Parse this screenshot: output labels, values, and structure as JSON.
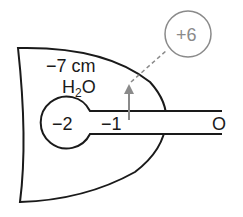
{
  "diagram": {
    "labels": {
      "pleural_pressure": "−7 cm",
      "pleural_unit": "H",
      "pleural_unit_sub": "2",
      "pleural_unit_tail": "O",
      "alveolar_pressure": "−2",
      "airway_pressure": "−1",
      "mouth_pressure": "O",
      "transmural_pressure": "+6"
    },
    "colors": {
      "outline": "#1a1a1a",
      "annotation": "#8a8a8a",
      "background": "#ffffff"
    }
  }
}
